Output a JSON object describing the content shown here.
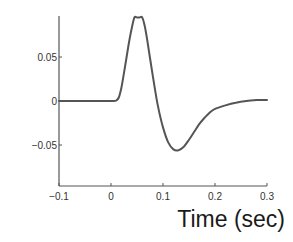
{
  "chart_data": {
    "type": "line",
    "title": "",
    "xlabel": "Time (sec)",
    "ylabel": "",
    "xlim": [
      -0.1,
      0.3
    ],
    "ylim": [
      -0.095,
      0.095
    ],
    "grid": false,
    "legend": null,
    "x_ticks": [
      -0.1,
      0,
      0.1,
      0.2,
      0.3
    ],
    "x_tick_labels": [
      "-0.1",
      "0",
      "0.1",
      "0.2",
      "0.3"
    ],
    "y_ticks": [
      0.05,
      0,
      -0.05
    ],
    "y_tick_labels": [
      "0.05",
      "0",
      "-0.05"
    ],
    "series": [
      {
        "name": "waveform",
        "color": "#555555",
        "x": [
          -0.1,
          -0.05,
          0.0,
          0.01,
          0.015,
          0.02,
          0.025,
          0.03,
          0.035,
          0.04,
          0.045,
          0.05,
          0.055,
          0.06,
          0.065,
          0.07,
          0.08,
          0.09,
          0.1,
          0.11,
          0.12,
          0.13,
          0.14,
          0.15,
          0.16,
          0.17,
          0.18,
          0.19,
          0.2,
          0.22,
          0.24,
          0.26,
          0.28,
          0.3
        ],
        "y": [
          0.0,
          0.0,
          0.0,
          0.0005,
          0.004,
          0.015,
          0.032,
          0.05,
          0.068,
          0.083,
          0.095,
          0.095,
          0.095,
          0.095,
          0.085,
          0.068,
          0.03,
          -0.005,
          -0.03,
          -0.047,
          -0.055,
          -0.056,
          -0.052,
          -0.044,
          -0.035,
          -0.026,
          -0.019,
          -0.013,
          -0.009,
          -0.005,
          -0.002,
          0.0,
          0.001,
          0.001
        ]
      }
    ]
  }
}
